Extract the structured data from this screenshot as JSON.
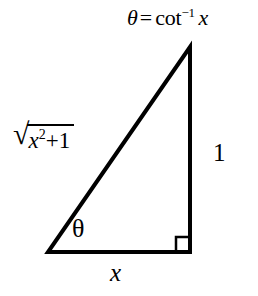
{
  "figure": {
    "type": "right-triangle-trig-diagram",
    "background_color": "#ffffff",
    "stroke_color": "#000000",
    "width": 258,
    "height": 296
  },
  "geometry": {
    "apex": {
      "x": 190,
      "y": 47
    },
    "bottom_left": {
      "x": 48,
      "y": 252
    },
    "bottom_right": {
      "x": 190,
      "y": 252
    },
    "stroke_width": 4,
    "right_angle_marker": {
      "size": 15,
      "at_vertex": "bottom_right"
    }
  },
  "labels": {
    "apex_equation": {
      "theta": "θ",
      "equals": "=",
      "function": "cot",
      "exponent": "−1",
      "argument": "x",
      "full_text": "θ = cot⁻¹ x"
    },
    "hypotenuse": {
      "radical": "√",
      "base": "x",
      "exponent": "2",
      "operator": "+",
      "addend": "1",
      "full_text": "√(x² + 1)"
    },
    "opposite_side": "1",
    "base_angle": "θ",
    "adjacent_side": "x"
  }
}
